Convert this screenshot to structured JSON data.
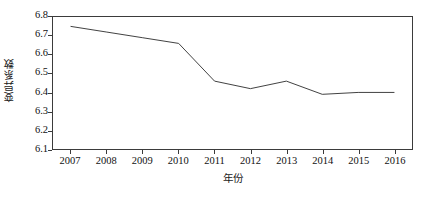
{
  "chart_data": {
    "type": "line",
    "title": "",
    "xlabel": "年份",
    "ylabel": "变异系数",
    "x": [
      2007,
      2008,
      2009,
      2010,
      2011,
      2012,
      2013,
      2014,
      2015,
      2016
    ],
    "categories": [
      "2007",
      "2008",
      "2009",
      "2010",
      "2011",
      "2012",
      "2013",
      "2014",
      "2015",
      "2016"
    ],
    "values": [
      6.75,
      6.72,
      6.69,
      6.66,
      6.46,
      6.42,
      6.46,
      6.39,
      6.4,
      6.4
    ],
    "series": [
      {
        "name": "变异系数",
        "values": [
          6.75,
          6.72,
          6.69,
          6.66,
          6.46,
          6.42,
          6.46,
          6.39,
          6.4,
          6.4
        ]
      }
    ],
    "ylim": [
      6.1,
      6.8
    ],
    "xlim": [
      2006.5,
      2016.5
    ],
    "yticks": [
      6.1,
      6.2,
      6.3,
      6.4,
      6.5,
      6.6,
      6.7,
      6.8
    ],
    "ytick_labels": [
      "6.1",
      "6.2",
      "6.3",
      "6.4",
      "6.5",
      "6.6",
      "6.7",
      "6.8"
    ],
    "xticks": [
      2007,
      2008,
      2009,
      2010,
      2011,
      2012,
      2013,
      2014,
      2015,
      2016
    ],
    "xtick_labels": [
      "2007",
      "2008",
      "2009",
      "2010",
      "2011",
      "2012",
      "2013",
      "2014",
      "2015",
      "2016"
    ],
    "grid": false,
    "legend": false,
    "legend_position": "none",
    "line_color": "#404040",
    "frame_color": "#3b3b3b",
    "background_color": "#ffffff",
    "markers": false,
    "annotations": []
  }
}
